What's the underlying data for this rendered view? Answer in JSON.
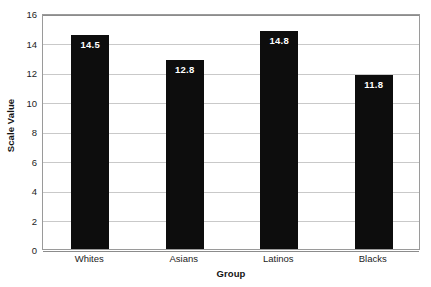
{
  "chart_data": {
    "type": "bar",
    "title": "",
    "xlabel": "Group",
    "ylabel": "Scale Value",
    "categories": [
      "Whites",
      "Asians",
      "Latinos",
      "Blacks"
    ],
    "values": [
      14.5,
      12.8,
      14.8,
      11.8
    ],
    "value_labels": [
      "14.5",
      "12.8",
      "14.8",
      "11.8"
    ],
    "ylim": [
      0,
      16
    ],
    "ytick_labels": [
      "0",
      "2",
      "4",
      "6",
      "8",
      "10",
      "12",
      "14",
      "16"
    ],
    "ytick_values": [
      0,
      2,
      4,
      6,
      8,
      10,
      12,
      14,
      16
    ],
    "grid": true,
    "legend": "none",
    "bar_color": "#0d0d0d",
    "value_label_color": "#ffffff",
    "gridline_color": "#c9c9c9",
    "axis_color": "#8c8c8c",
    "plot_background": "#ffffff"
  }
}
